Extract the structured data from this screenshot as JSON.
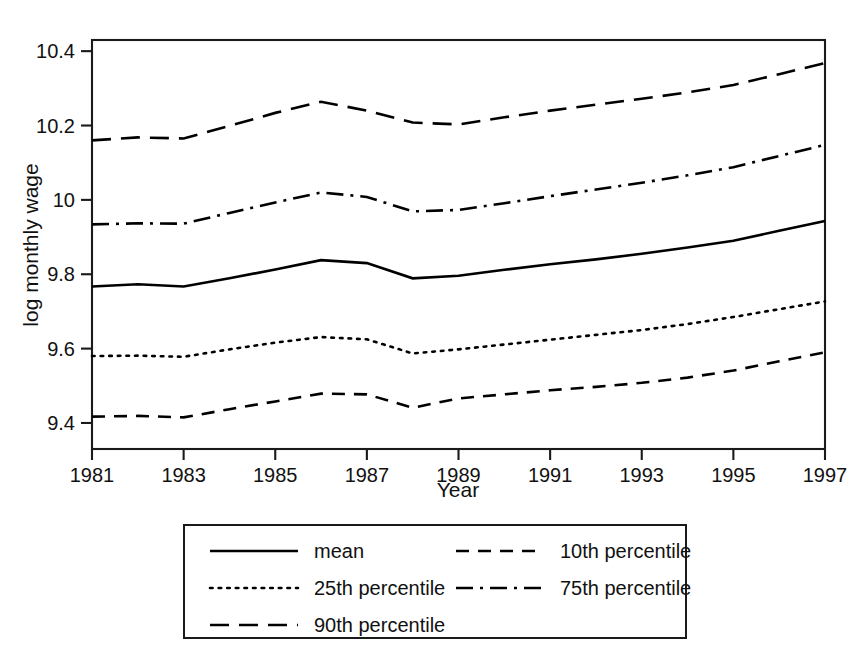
{
  "chart_data": {
    "type": "line",
    "title": "",
    "xlabel": "Year",
    "ylabel": "log monthly wage",
    "xlim": [
      1981,
      1997
    ],
    "ylim": [
      9.33,
      10.43
    ],
    "grid": false,
    "legend_position": "bottom",
    "x": [
      1981,
      1982,
      1983,
      1984,
      1985,
      1986,
      1987,
      1988,
      1989,
      1990,
      1991,
      1992,
      1993,
      1994,
      1995,
      1996,
      1997
    ],
    "xticks": [
      "1981",
      "1983",
      "1985",
      "1987",
      "1989",
      "1991",
      "1993",
      "1995",
      "1997"
    ],
    "xtick_values": [
      1981,
      1983,
      1985,
      1987,
      1989,
      1991,
      1993,
      1995,
      1997
    ],
    "yticks": [
      "9.4",
      "9.6",
      "9.8",
      "10",
      "10.2",
      "10.4"
    ],
    "ytick_values": [
      9.4,
      9.6,
      9.8,
      10.0,
      10.2,
      10.4
    ],
    "series": [
      {
        "name": "mean",
        "style": "solid",
        "values": [
          9.767,
          9.773,
          9.767,
          9.789,
          9.813,
          9.838,
          9.83,
          9.789,
          9.796,
          9.812,
          9.827,
          9.84,
          9.855,
          9.872,
          9.89,
          9.917,
          9.943
        ]
      },
      {
        "name": "10th percentile",
        "style": "dashed",
        "values": [
          9.417,
          9.419,
          9.415,
          9.437,
          9.458,
          9.479,
          9.477,
          9.441,
          9.466,
          9.477,
          9.488,
          9.497,
          9.508,
          9.522,
          9.541,
          9.566,
          9.59
        ]
      },
      {
        "name": "25th percentile",
        "style": "dotted",
        "values": [
          9.58,
          9.581,
          9.578,
          9.598,
          9.616,
          9.631,
          9.625,
          9.587,
          9.598,
          9.611,
          9.624,
          9.637,
          9.65,
          9.666,
          9.685,
          9.706,
          9.727
        ]
      },
      {
        "name": "75th percentile",
        "style": "dashdot",
        "values": [
          9.934,
          9.937,
          9.936,
          9.965,
          9.993,
          10.02,
          10.008,
          9.969,
          9.973,
          9.991,
          10.01,
          10.028,
          10.046,
          10.066,
          10.088,
          10.118,
          10.148
        ]
      },
      {
        "name": "90th percentile",
        "style": "longdash",
        "values": [
          10.16,
          10.168,
          10.165,
          10.199,
          10.234,
          10.264,
          10.24,
          10.208,
          10.203,
          10.222,
          10.24,
          10.256,
          10.272,
          10.289,
          10.309,
          10.338,
          10.368
        ]
      }
    ]
  },
  "legend": {
    "entries": [
      {
        "label": "mean",
        "style": "solid"
      },
      {
        "label": "10th percentile",
        "style": "dashed"
      },
      {
        "label": "25th percentile",
        "style": "dotted"
      },
      {
        "label": "75th percentile",
        "style": "dashdot"
      },
      {
        "label": "90th percentile",
        "style": "longdash"
      }
    ]
  }
}
